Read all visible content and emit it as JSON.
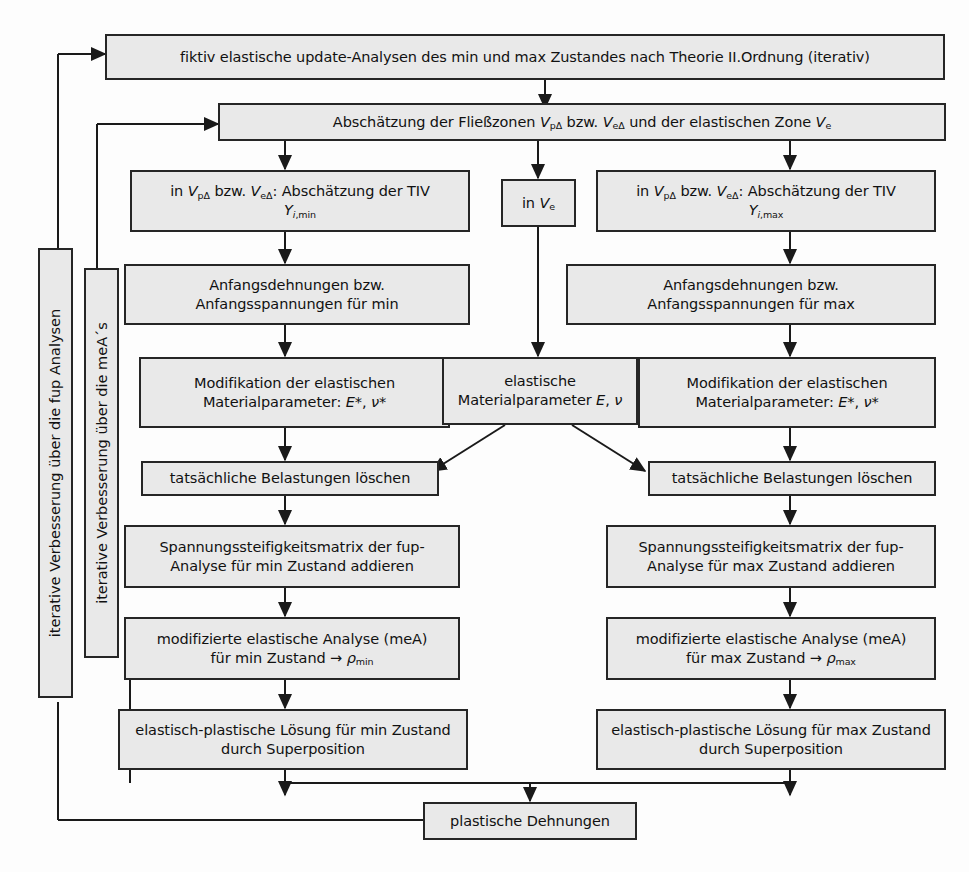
{
  "diagram": {
    "language": "de",
    "box_fill": "#e9e9e9",
    "box_border": "#262626",
    "background": "#fdfdfd",
    "nodes": {
      "top_fiktiv": "fiktiv elastische update-Analysen des min und max Zustandes nach Theorie II.Ordnung (iterativ)",
      "abschaetzung_zonen": "Abschätzung der Fließzonen V_pΔ bzw. V_eΔ und der elastischen Zone V_e",
      "tiv_min": "in V_pΔ bzw. V_eΔ: Abschätzung der TIV Y_i,min",
      "in_ve": "in V_e",
      "tiv_max": "in V_pΔ bzw. V_eΔ: Abschätzung der TIV Y_i,max",
      "anfang_min": "Anfangsdehnungen bzw. Anfangsspannungen für min",
      "anfang_max": "Anfangsdehnungen bzw. Anfangsspannungen für max",
      "modif_min": "Modifikation der elastischen Materialparameter: E*, ν*",
      "elastische_mat": "elastische Materialparameter E, ν",
      "modif_max": "Modifikation der elastischen Materialparameter: E*, ν*",
      "loeschen_min": "tatsächliche Belastungen löschen",
      "loeschen_max": "tatsächliche Belastungen löschen",
      "steif_min": "Spannungssteifigkeitsmatrix der fup-Analyse für min Zustand addieren",
      "steif_max": "Spannungssteifigkeitsmatrix der fup-Analyse für max Zustand addieren",
      "mea_min": "modifizierte elastische Analyse (meA) für min Zustand → ρ_min",
      "mea_max": "modifizierte elastische Analyse (meA) für max Zustand → ρ_max",
      "loesung_min": "elastisch-plastische Lösung für min Zustand durch Superposition",
      "loesung_max": "elastisch-plastische Lösung für max Zustand durch Superposition",
      "plastische": "plastische Dehnungen"
    },
    "vertical_labels": {
      "outer": "iterative Verbesserung über die fup Analysen",
      "inner": "iterative Verbesserung über die meA´s"
    },
    "symbols": {
      "volume_plastic": "V",
      "volume_plastic_sub": "pΔ",
      "volume_elastic_delta_sub": "eΔ",
      "volume_elastic_sub": "e",
      "tiv": "TIV",
      "tiv_sym": "Y",
      "tiv_min_sub": "i,min",
      "tiv_max_sub": "i,max",
      "youngs_modulus": "E",
      "poisson": "ν",
      "modified_marker": "*",
      "residual": "ρ",
      "residual_min_sub": "min",
      "residual_max_sub": "max",
      "arrow_right": "→",
      "bzw": "bzw."
    }
  }
}
